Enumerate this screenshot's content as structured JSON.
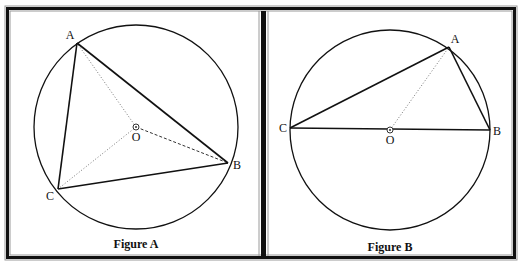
{
  "frame": {
    "outer": {
      "x": 8,
      "y": 8,
      "w": 510,
      "h": 252
    },
    "divider_x": 263,
    "colors": {
      "dark": "#111111",
      "light": "#9a9a9a",
      "paper": "#ffffff"
    }
  },
  "figures": [
    {
      "id": "A",
      "caption": "Figure A",
      "caption_pos": {
        "x": 136,
        "y": 248
      },
      "circle": {
        "cx": 136,
        "cy": 127,
        "r": 102
      },
      "center": {
        "label": "O",
        "x": 136,
        "y": 127,
        "label_x": 136,
        "label_y": 141
      },
      "points": [
        {
          "label": "A",
          "x": 77,
          "y": 43,
          "label_x": 70,
          "label_y": 39
        },
        {
          "label": "B",
          "x": 228,
          "y": 163,
          "label_x": 237,
          "label_y": 169
        },
        {
          "label": "C",
          "x": 58,
          "y": 189,
          "label_x": 50,
          "label_y": 200
        }
      ],
      "solid_segments": [
        [
          "A",
          "B"
        ],
        [
          "B",
          "C"
        ],
        [
          "C",
          "A"
        ]
      ],
      "dotted_segments": [
        [
          "O",
          "A"
        ],
        [
          "O",
          "C"
        ]
      ],
      "dashed_segments": [
        [
          "O",
          "B"
        ]
      ]
    },
    {
      "id": "B",
      "caption": "Figure B",
      "caption_pos": {
        "x": 390,
        "y": 251
      },
      "circle": {
        "cx": 390,
        "cy": 130,
        "r": 100
      },
      "center": {
        "label": "O",
        "x": 390,
        "y": 130,
        "label_x": 390,
        "label_y": 144
      },
      "points": [
        {
          "label": "A",
          "x": 449,
          "y": 47,
          "label_x": 455,
          "label_y": 43
        },
        {
          "label": "B",
          "x": 490,
          "y": 130,
          "label_x": 497,
          "label_y": 135
        },
        {
          "label": "C",
          "x": 290,
          "y": 128,
          "label_x": 283,
          "label_y": 132
        }
      ],
      "solid_segments": [
        [
          "C",
          "A"
        ],
        [
          "A",
          "B"
        ],
        [
          "C",
          "B"
        ]
      ],
      "dotted_segments": [
        [
          "O",
          "A"
        ]
      ],
      "dashed_segments": []
    }
  ]
}
